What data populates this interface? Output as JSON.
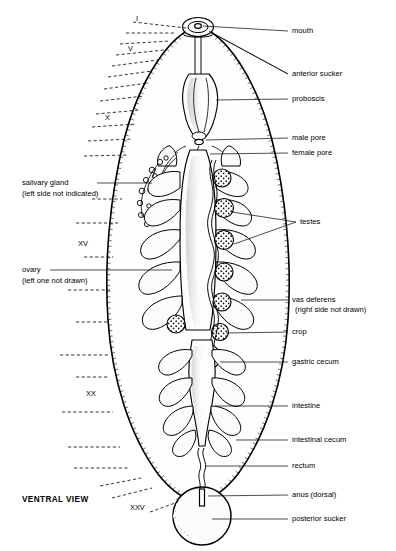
{
  "figure": {
    "view_label": "VENTRAL VIEW"
  },
  "right_labels": [
    {
      "id": "mouth",
      "text": "mouth",
      "x": 292,
      "y": 33
    },
    {
      "id": "anterior-sucker",
      "text": "anterior sucker",
      "x": 292,
      "y": 76
    },
    {
      "id": "proboscis",
      "text": "proboscis",
      "x": 292,
      "y": 101
    },
    {
      "id": "male-pore",
      "text": "male pore",
      "x": 292,
      "y": 140
    },
    {
      "id": "female-pore",
      "text": "female pore",
      "x": 292,
      "y": 155
    },
    {
      "id": "testes",
      "text": "testes",
      "x": 300,
      "y": 224
    },
    {
      "id": "vas-deferens",
      "text": "vas deferens",
      "x": 292,
      "y": 302
    },
    {
      "id": "vas-deferens-note",
      "text": "(right side not drawn)",
      "x": 295,
      "y": 312
    },
    {
      "id": "crop",
      "text": "crop",
      "x": 292,
      "y": 334
    },
    {
      "id": "gastric-cecum",
      "text": "gastric cecum",
      "x": 292,
      "y": 364
    },
    {
      "id": "intestine",
      "text": "intestine",
      "x": 292,
      "y": 408
    },
    {
      "id": "intestinal-cecum",
      "text": "intestinal cecum",
      "x": 292,
      "y": 442
    },
    {
      "id": "rectum",
      "text": "rectum",
      "x": 292,
      "y": 468
    },
    {
      "id": "anus-dorsal",
      "text": "anus (dorsal)",
      "x": 292,
      "y": 497
    },
    {
      "id": "posterior-sucker",
      "text": "posterior sucker",
      "x": 292,
      "y": 521
    }
  ],
  "left_labels": [
    {
      "id": "salivary-gland",
      "text": "salivary gland",
      "x": 22,
      "y": 185
    },
    {
      "id": "salivary-gland-note",
      "text": "(left side not indicated)",
      "x": 22,
      "y": 196
    },
    {
      "id": "ovary",
      "text": "ovary",
      "x": 22,
      "y": 272
    },
    {
      "id": "ovary-note",
      "text": "(left one not drawn)",
      "x": 22,
      "y": 283
    }
  ],
  "roman_numerals": [
    {
      "id": "I",
      "text": "I",
      "x": 136,
      "y": 21
    },
    {
      "id": "V",
      "text": "V",
      "x": 128,
      "y": 51
    },
    {
      "id": "X",
      "text": "X",
      "x": 105,
      "y": 120
    },
    {
      "id": "XV",
      "text": "XV",
      "x": 78,
      "y": 246
    },
    {
      "id": "XX",
      "text": "XX",
      "x": 86,
      "y": 396
    },
    {
      "id": "XXV",
      "text": "XXV",
      "x": 130,
      "y": 510
    }
  ],
  "colors": {
    "ink": "#000000",
    "paper": "#ffffff",
    "organ_fill": "#fdfdfd"
  }
}
